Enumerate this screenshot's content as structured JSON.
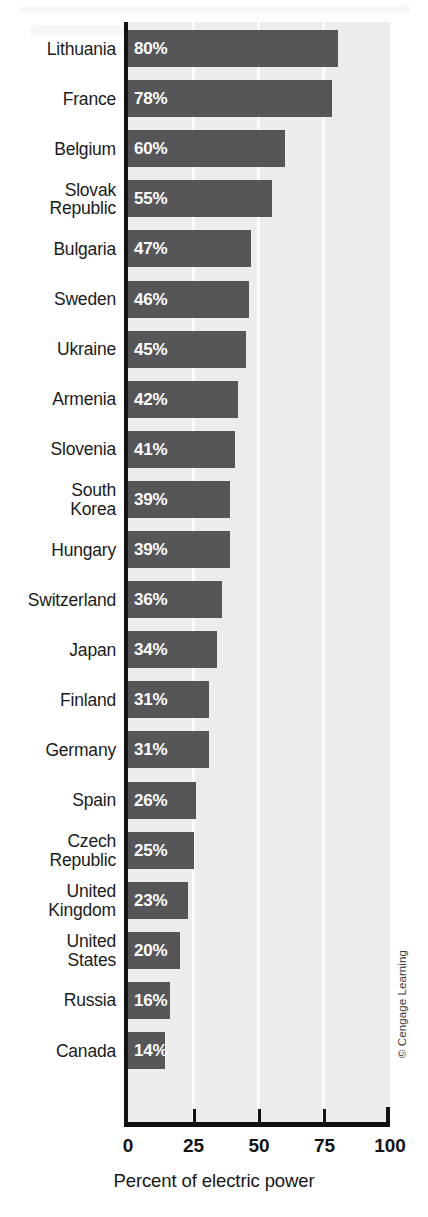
{
  "chart_data": {
    "type": "bar",
    "orientation": "horizontal",
    "title": "",
    "xlabel": "Percent of electric power",
    "ylabel": "",
    "xlim": [
      0,
      100
    ],
    "xticks": [
      "0",
      "25",
      "50",
      "75",
      "100"
    ],
    "grid": true,
    "gridlines_at": [
      25,
      50,
      75
    ],
    "legend": null,
    "categories": [
      "Lithuania",
      "France",
      "Belgium",
      "Slovak\nRepublic",
      "Bulgaria",
      "Sweden",
      "Ukraine",
      "Armenia",
      "Slovenia",
      "South\nKorea",
      "Hungary",
      "Switzerland",
      "Japan",
      "Finland",
      "Germany",
      "Spain",
      "Czech\nRepublic",
      "United\nKingdom",
      "United\nStates",
      "Russia",
      "Canada"
    ],
    "values": [
      80,
      78,
      60,
      55,
      47,
      46,
      45,
      42,
      41,
      39,
      39,
      36,
      34,
      31,
      31,
      26,
      25,
      23,
      20,
      16,
      14
    ],
    "data_labels": [
      "80%",
      "78%",
      "60%",
      "55%",
      "47%",
      "46%",
      "45%",
      "42%",
      "41%",
      "39%",
      "39%",
      "36%",
      "34%",
      "31%",
      "31%",
      "26%",
      "25%",
      "23%",
      "20%",
      "16%",
      "14%"
    ],
    "colors": {
      "bar": "#565659",
      "plot_background": "#ececed",
      "gridline": "#fbfbfb",
      "axis": "#121212",
      "data_label_text": "#ffffff",
      "category_label_text": "#1b1b1b"
    }
  },
  "credit": "© Cengage Learning"
}
